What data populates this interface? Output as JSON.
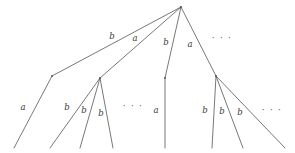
{
  "figure": {
    "background_color": "#ffffff",
    "stroke_color": "#555558",
    "label_color": "#3a3a3c",
    "width": 295,
    "height": 153
  },
  "nodes": [
    {
      "id": "root",
      "name": "root-node",
      "x": 181,
      "y": 7
    },
    {
      "id": "bend-left",
      "name": "left-bend-node",
      "x": 52,
      "y": 76
    },
    {
      "id": "fan-left",
      "name": "left-fan-node",
      "x": 100,
      "y": 78
    },
    {
      "id": "bend-mid",
      "name": "middle-bend-node",
      "x": 165,
      "y": 78
    },
    {
      "id": "fan-right",
      "name": "right-fan-node",
      "x": 216,
      "y": 76
    }
  ],
  "edges": [
    {
      "id": "e1",
      "name": "edge-root-to-left-bend",
      "label": "b",
      "from": "root",
      "to": "bend-left",
      "points": "181,7 52,76",
      "label_x": 112,
      "label_y": 36
    },
    {
      "id": "e2",
      "name": "edge-root-to-left-fan",
      "label": "a",
      "from": "root",
      "to": "fan-left",
      "points": "181,7 100,78",
      "label_x": 135,
      "label_y": 38
    },
    {
      "id": "e3",
      "name": "edge-root-to-middle-bend",
      "label": "b",
      "from": "root",
      "to": "bend-mid",
      "points": "181,7 165,78",
      "label_x": 166,
      "label_y": 42
    },
    {
      "id": "e4",
      "name": "edge-root-to-right-fan",
      "label": "a",
      "from": "root",
      "to": "fan-right",
      "points": "181,7 216,76",
      "label_x": 190,
      "label_y": 44
    },
    {
      "id": "e5",
      "name": "edge-left-bend-to-leaf-1",
      "label": "a",
      "from": "bend-left",
      "to": "leaf-1",
      "points": "52,76 14,148",
      "label_x": 23,
      "label_y": 107
    },
    {
      "id": "e6",
      "name": "edge-left-fan-to-leaf-2",
      "label": "b",
      "from": "fan-left",
      "to": "leaf-2",
      "points": "100,78 50,148",
      "label_x": 67,
      "label_y": 107
    },
    {
      "id": "e7",
      "name": "edge-left-fan-to-leaf-3",
      "label": "b",
      "from": "fan-left",
      "to": "leaf-3",
      "points": "100,78 80,148",
      "label_x": 84,
      "label_y": 110
    },
    {
      "id": "e8",
      "name": "edge-left-fan-to-leaf-4",
      "label": "b",
      "from": "fan-left",
      "to": "leaf-4",
      "points": "100,78 113,148",
      "label_x": 101,
      "label_y": 113
    },
    {
      "id": "e9",
      "name": "edge-middle-bend-to-leaf-5",
      "label": "a",
      "from": "bend-mid",
      "to": "leaf-5",
      "points": "165,78 165,148",
      "label_x": 156,
      "label_y": 110
    },
    {
      "id": "e10",
      "name": "edge-right-fan-to-leaf-6",
      "label": "b",
      "from": "fan-right",
      "to": "leaf-6",
      "points": "216,76 212,148",
      "label_x": 205,
      "label_y": 110
    },
    {
      "id": "e11",
      "name": "edge-right-fan-to-leaf-7",
      "label": "b",
      "from": "fan-right",
      "to": "leaf-7",
      "points": "216,76 243,148",
      "label_x": 222,
      "label_y": 111
    },
    {
      "id": "e12",
      "name": "edge-right-fan-to-leaf-8",
      "label": "b",
      "from": "fan-right",
      "to": "leaf-8",
      "points": "216,76 285,148",
      "label_x": 240,
      "label_y": 112
    }
  ],
  "ellipses": [
    {
      "id": "d1",
      "name": "ellipsis-top-right",
      "text": "· · ·",
      "x": 222,
      "y": 38
    },
    {
      "id": "d2",
      "name": "ellipsis-lower-middle",
      "text": "· · ·",
      "x": 133,
      "y": 106
    },
    {
      "id": "d3",
      "name": "ellipsis-lower-right",
      "text": "· · ·",
      "x": 272,
      "y": 110
    }
  ]
}
